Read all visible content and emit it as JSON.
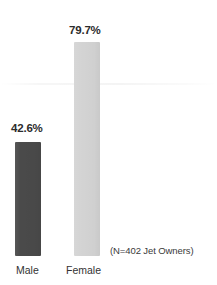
{
  "chart_data": {
    "type": "bar",
    "title": "",
    "subtitle": "",
    "xlabel": "",
    "ylabel": "",
    "categories": [
      "Male",
      "Female"
    ],
    "values": [
      42.6,
      79.7
    ],
    "value_labels": [
      "42.6%",
      "79.7%"
    ],
    "unit": "%",
    "ylim": [
      0,
      100
    ],
    "grid": false,
    "axes_visible": false,
    "legend": null,
    "legend_position": "none",
    "annotations": [
      "(N=402 Jet Owners)"
    ],
    "series": [
      {
        "name": "Percent",
        "values": [
          42.6,
          79.7
        ],
        "colors": [
          "#4a4a4a",
          "#d4d4d4"
        ]
      }
    ],
    "bar_colors": {
      "male": "#4a4a4a",
      "female": "#d4d4d4"
    }
  },
  "labels": {
    "male_value": "42.6%",
    "female_value": "79.7%",
    "male_category": "Male",
    "female_category": "Female",
    "sample_note": "(N=402 Jet Owners)"
  },
  "colors": {
    "background": "#ffffff",
    "male_bar": "#4a4a4a",
    "female_bar": "#d4d4d4",
    "value_text": "#2b2b2b",
    "category_text": "#333333",
    "note_text": "#3a3a3a"
  }
}
